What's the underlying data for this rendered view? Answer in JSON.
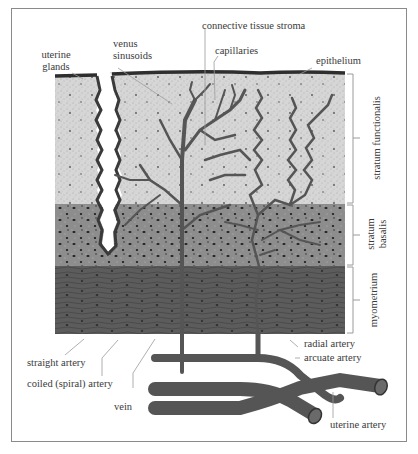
{
  "figure": {
    "labels_top": {
      "uterine_glands": [
        "uterine",
        "glands"
      ],
      "venus_sinusoids": [
        "venus",
        "sinusoids"
      ],
      "connective_tissue_stroma": "connective tissue stroma",
      "capillaries": "capillaries",
      "epithelium": "epithelium"
    },
    "layers": [
      {
        "name": "stratum functionalis",
        "lines": [
          "stratum functionalis"
        ],
        "color": "#d9d9d9"
      },
      {
        "name": "stratum basalis",
        "lines": [
          "stratum",
          "basalis"
        ],
        "color": "#8f8f8f"
      },
      {
        "name": "myometrium",
        "lines": [
          "myometrium"
        ],
        "color": "#5e5e5e"
      }
    ],
    "labels_bottom": {
      "straight_artery": "straight artery",
      "coiled_artery": "coiled (spiral) artery",
      "vein": "vein",
      "radial_artery": "radial artery",
      "arcuate_artery": "arcuate artery",
      "uterine_artery": "uterine artery"
    },
    "colors": {
      "frame": "#8a8a8a",
      "vessel": "#555555",
      "epithelium": "#2e2e2e",
      "leader_line": "#9a9a9a"
    }
  }
}
